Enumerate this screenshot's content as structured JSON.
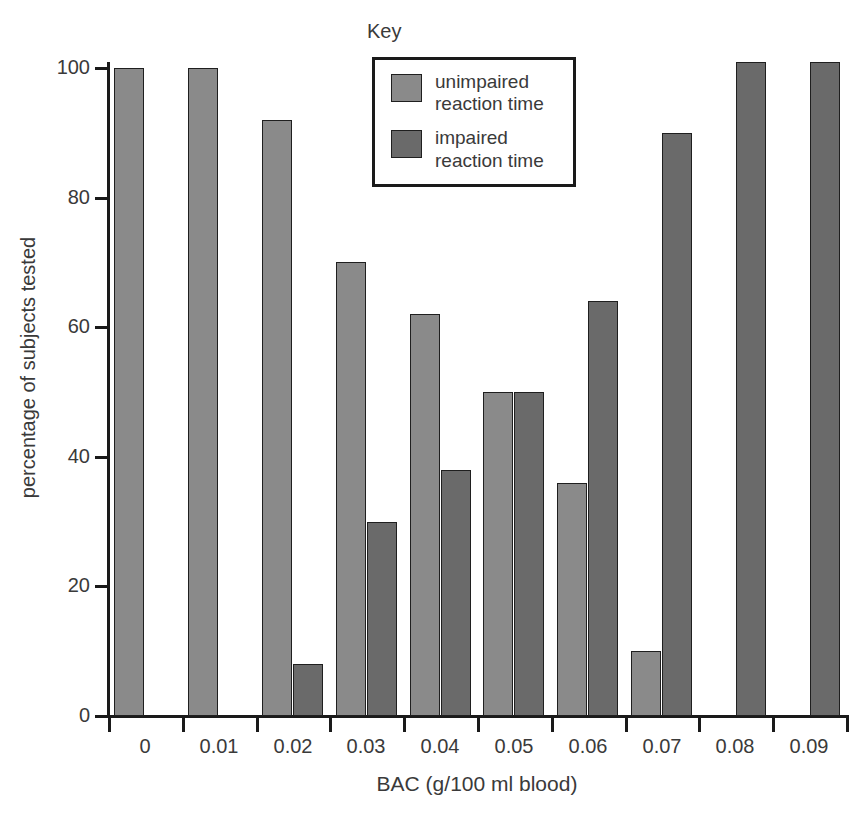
{
  "chart_data": {
    "type": "bar",
    "title": "",
    "xlabel": "BAC (g/100 ml blood)",
    "ylabel": "percentage of subjects tested",
    "categories": [
      "0",
      "0.01",
      "0.02",
      "0.03",
      "0.04",
      "0.05",
      "0.06",
      "0.07",
      "0.08",
      "0.09"
    ],
    "ylim": [
      0,
      100
    ],
    "yticks": [
      "0",
      "20",
      "40",
      "60",
      "80",
      "100"
    ],
    "grid": false,
    "legend_position": "top-center",
    "legend_title": "Key",
    "series": [
      {
        "name": "unimpaired reaction time",
        "color": "#8a8a8a",
        "values": [
          100,
          100,
          92,
          70,
          62,
          50,
          36,
          10,
          0,
          0
        ]
      },
      {
        "name": "impaired reaction time",
        "color": "#6a6a6a",
        "values": [
          0,
          0,
          8,
          30,
          38,
          50,
          64,
          90,
          101,
          101
        ]
      }
    ]
  },
  "legend": {
    "caption": "Key",
    "entries": [
      {
        "label": "unimpaired\nreaction time",
        "color": "#8a8a8a"
      },
      {
        "label": "impaired\nreaction time",
        "color": "#6a6a6a"
      }
    ]
  },
  "axes": {
    "y_title": "percentage of subjects tested",
    "x_title": "BAC (g/100 ml blood)"
  },
  "colors": {
    "unimpaired": "#8a8a8a",
    "impaired": "#6a6a6a",
    "axis": "#1a1a1a",
    "text": "#3a3a3a",
    "background": "#ffffff"
  }
}
